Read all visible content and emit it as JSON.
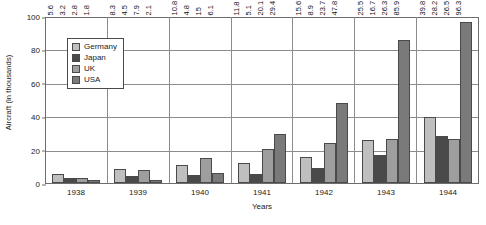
{
  "chart_data": {
    "type": "bar",
    "title": "",
    "xlabel": "Years",
    "ylabel": "Aircraft (in thousands)",
    "ylim": [
      0,
      100
    ],
    "yticks": [
      0,
      20,
      40,
      60,
      80,
      100
    ],
    "grid": true,
    "legend_position": "upper-left-inside",
    "categories": [
      "1938",
      "1939",
      "1940",
      "1941",
      "1942",
      "1943",
      "1944"
    ],
    "series": [
      {
        "name": "Germany",
        "color": "#bfbfbf",
        "values": [
          5.6,
          8.3,
          10.8,
          11.8,
          15.6,
          25.5,
          39.8
        ],
        "labels": [
          "5.6",
          "8.3",
          "10.8",
          "11.8",
          "15.6",
          "25.5",
          "39.8"
        ]
      },
      {
        "name": "Japan",
        "color": "#4a4a4a",
        "values": [
          3.2,
          4.5,
          4.8,
          5.1,
          8.9,
          16.7,
          28.2
        ],
        "labels": [
          "3.2",
          "4.5",
          "4.8",
          "5.1",
          "8.9",
          "16.7",
          "28.2"
        ]
      },
      {
        "name": "UK",
        "color": "#9e9e9e",
        "values": [
          2.8,
          7.9,
          15,
          20.1,
          23.7,
          26.3,
          26.5
        ],
        "labels": [
          "2.8",
          "7.9",
          "15",
          "20.1",
          "23.7",
          "26.3",
          "26.5"
        ]
      },
      {
        "name": "USA",
        "color": "#7a7a7a",
        "values": [
          1.8,
          2.1,
          6.1,
          29.4,
          47.8,
          85.9,
          96.3
        ],
        "labels": [
          "1.8",
          "2.1",
          "6.1",
          "29.4",
          "47.8",
          "85.9",
          "96.3"
        ]
      }
    ]
  }
}
